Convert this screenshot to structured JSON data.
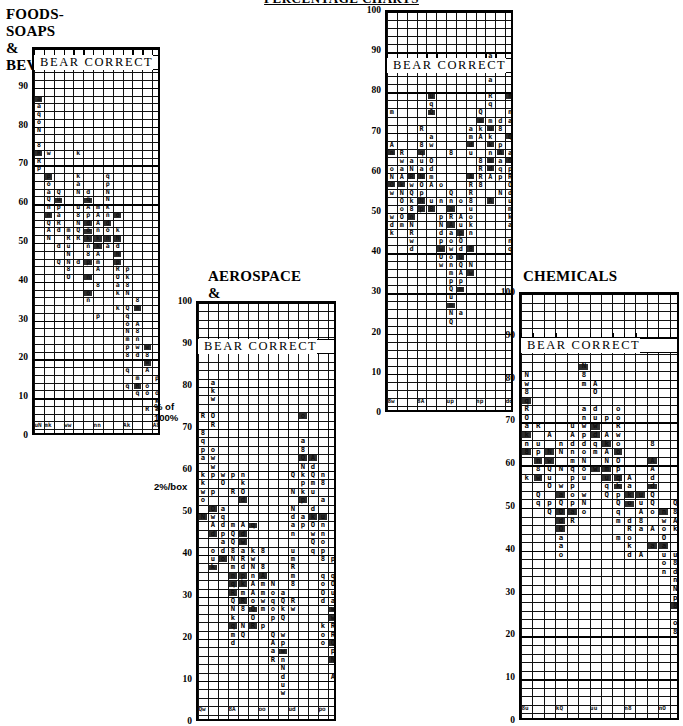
{
  "page": {
    "title": "PERCENTAGE CHARTS",
    "scale_note_top": "% of\n100%",
    "scale_note_bottom": "2%/box"
  },
  "chart_data": [
    {
      "id": "foods-soaps-beverages",
      "type": "heatmap",
      "title": "FOODS-SOAPS\n& BEVERAGES-",
      "band_label": "BEAR  CORRECT",
      "ylabel": "% of 100%",
      "xlabel": "",
      "ylim": [
        0,
        100
      ],
      "yticks": [
        90,
        80,
        70,
        60,
        50,
        40,
        30,
        20,
        10,
        0
      ],
      "grid": true,
      "box_value": "2%/box",
      "columns": 13,
      "rows": 50,
      "categories": [
        "c1",
        "c2",
        "c3",
        "c4",
        "c5",
        "c6",
        "c7",
        "c8",
        "c9",
        "c10",
        "c11",
        "c12",
        "c13"
      ],
      "values": [
        78,
        62,
        55,
        50,
        58,
        52,
        46,
        60,
        44,
        30,
        26,
        12,
        8
      ],
      "note": "Hand-plotted distribution of analyst percentage estimates; each small box = 2%."
    },
    {
      "id": "aerospace-airlines",
      "type": "heatmap",
      "title": "AEROSPACE &\nAIRLINES",
      "band_label": "BEAR  CORRECT",
      "ylabel": "% of 100%",
      "xlabel": "",
      "ylim": [
        0,
        100
      ],
      "yticks": [
        100,
        90,
        80,
        70,
        60,
        50,
        40,
        30,
        20,
        10,
        0
      ],
      "grid": true,
      "box_value": "2%/box",
      "columns": 14,
      "rows": 50,
      "categories": [
        "c1",
        "c2",
        "c3",
        "c4",
        "c5",
        "c6",
        "c7",
        "c8",
        "c9",
        "c10",
        "c11",
        "c12",
        "c13",
        "c14"
      ],
      "values": [
        66,
        58,
        46,
        40,
        38,
        34,
        30,
        24,
        16,
        44,
        60,
        52,
        42,
        30
      ],
      "note": "Hand-plotted distribution of analyst percentage estimates; each small box = 2%."
    },
    {
      "id": "waste-mangmt",
      "type": "heatmap",
      "title": "WASTE\nMANGMT",
      "band_label": "BEAR  CORRECT",
      "ylabel": "% of 100%",
      "xlabel": "",
      "ylim": [
        0,
        100
      ],
      "yticks": [
        100,
        90,
        80,
        70,
        60,
        50,
        40,
        30,
        20,
        10,
        0
      ],
      "grid": true,
      "box_value": "2%/box",
      "columns": 13,
      "rows": 50,
      "categories": [
        "c1",
        "c2",
        "c3",
        "c4",
        "c5",
        "c6",
        "c7",
        "c8",
        "c9",
        "c10",
        "c11",
        "c12",
        "c13"
      ],
      "values": [
        62,
        58,
        54,
        60,
        66,
        48,
        44,
        40,
        56,
        64,
        70,
        66,
        58
      ],
      "note": "Hand-plotted distribution of analyst percentage estimates; each small box = 2%."
    },
    {
      "id": "chemicals",
      "type": "heatmap",
      "title": "CHEMICALS",
      "band_label": "BEAR  CORRECT",
      "ylabel": "% of 100%",
      "xlabel": "",
      "ylim": [
        0,
        100
      ],
      "yticks": [
        100,
        90,
        80,
        70,
        60,
        50,
        40,
        30,
        20,
        10,
        0
      ],
      "grid": true,
      "box_value": "2%/box",
      "columns": 14,
      "rows": 50,
      "categories": [
        "c1",
        "c2",
        "c3",
        "c4",
        "c5",
        "c6",
        "c7",
        "c8",
        "c9",
        "c10",
        "c11",
        "c12",
        "c13",
        "c14"
      ],
      "values": [
        70,
        64,
        58,
        52,
        60,
        66,
        72,
        62,
        56,
        50,
        46,
        54,
        44,
        36
      ],
      "note": "Hand-plotted distribution of analyst percentage estimates; each small box = 2%."
    }
  ]
}
